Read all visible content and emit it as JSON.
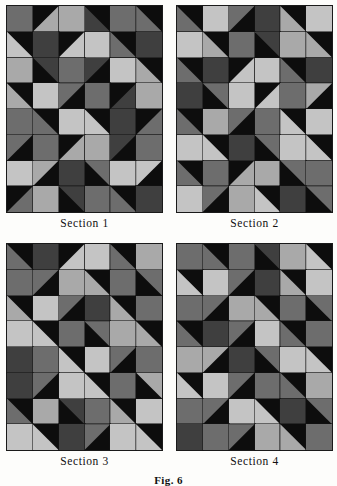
{
  "figure": {
    "label": "Fig. 6",
    "palette": {
      "black": "#0d0d0d",
      "dark_gray": "#3f3f3f",
      "mid_gray": "#6d6d6d",
      "light_gray": "#a9a9a9",
      "pale_gray": "#c4c4c4",
      "background": "#fdfdfb"
    },
    "grid": {
      "columns": 6,
      "rows": 8
    },
    "panels": [
      {
        "caption": "Section 1",
        "x": 6,
        "y": 5,
        "width": 157,
        "height": 208,
        "cells": [
          [
            {
              "base": "mid_gray"
            },
            {
              "base": "black",
              "tri": "light_gray",
              "dir": "br"
            },
            {
              "base": "light_gray"
            },
            {
              "base": "dark_gray",
              "tri": "black",
              "dir": "tr"
            },
            {
              "base": "mid_gray"
            },
            {
              "base": "black",
              "tri": "mid_gray",
              "dir": "bl"
            }
          ],
          [
            {
              "base": "black",
              "tri": "pale_gray",
              "dir": "bl"
            },
            {
              "base": "dark_gray"
            },
            {
              "base": "black",
              "tri": "pale_gray",
              "dir": "br"
            },
            {
              "base": "pale_gray"
            },
            {
              "base": "black",
              "tri": "mid_gray",
              "dir": "bl"
            },
            {
              "base": "dark_gray"
            }
          ],
          [
            {
              "base": "light_gray"
            },
            {
              "base": "black",
              "tri": "dark_gray",
              "dir": "tr"
            },
            {
              "base": "mid_gray"
            },
            {
              "base": "dark_gray",
              "tri": "black",
              "dir": "br"
            },
            {
              "base": "pale_gray"
            },
            {
              "base": "black",
              "tri": "light_gray",
              "dir": "bl"
            }
          ],
          [
            {
              "base": "black",
              "tri": "light_gray",
              "dir": "bl"
            },
            {
              "base": "pale_gray"
            },
            {
              "base": "black",
              "tri": "mid_gray",
              "dir": "tl"
            },
            {
              "base": "mid_gray"
            },
            {
              "base": "black",
              "tri": "dark_gray",
              "dir": "br"
            },
            {
              "base": "light_gray"
            }
          ],
          [
            {
              "base": "mid_gray"
            },
            {
              "base": "black",
              "tri": "mid_gray",
              "dir": "bl"
            },
            {
              "base": "pale_gray"
            },
            {
              "base": "black",
              "tri": "pale_gray",
              "dir": "bl"
            },
            {
              "base": "dark_gray"
            },
            {
              "base": "black",
              "tri": "mid_gray",
              "dir": "br"
            }
          ],
          [
            {
              "base": "black",
              "tri": "mid_gray",
              "dir": "tl"
            },
            {
              "base": "mid_gray"
            },
            {
              "base": "black",
              "tri": "light_gray",
              "dir": "br"
            },
            {
              "base": "light_gray"
            },
            {
              "base": "dark_gray",
              "tri": "black",
              "dir": "br"
            },
            {
              "base": "mid_gray"
            }
          ],
          [
            {
              "base": "pale_gray"
            },
            {
              "base": "black",
              "tri": "light_gray",
              "dir": "tl"
            },
            {
              "base": "dark_gray"
            },
            {
              "base": "black",
              "tri": "mid_gray",
              "dir": "tr"
            },
            {
              "base": "pale_gray"
            },
            {
              "base": "black",
              "tri": "pale_gray",
              "dir": "tl"
            }
          ],
          [
            {
              "base": "black",
              "tri": "mid_gray",
              "dir": "br"
            },
            {
              "base": "light_gray"
            },
            {
              "base": "black",
              "tri": "dark_gray",
              "dir": "tr"
            },
            {
              "base": "mid_gray"
            },
            {
              "base": "black",
              "tri": "mid_gray",
              "dir": "bl"
            },
            {
              "base": "dark_gray"
            }
          ]
        ]
      },
      {
        "caption": "Section 2",
        "x": 176,
        "y": 5,
        "width": 157,
        "height": 208,
        "cells": [
          [
            {
              "base": "black",
              "tri": "mid_gray",
              "dir": "bl"
            },
            {
              "base": "pale_gray"
            },
            {
              "base": "black",
              "tri": "mid_gray",
              "dir": "tl"
            },
            {
              "base": "dark_gray"
            },
            {
              "base": "black",
              "tri": "light_gray",
              "dir": "bl"
            },
            {
              "base": "pale_gray"
            }
          ],
          [
            {
              "base": "pale_gray"
            },
            {
              "base": "black",
              "tri": "light_gray",
              "dir": "bl"
            },
            {
              "base": "mid_gray"
            },
            {
              "base": "black",
              "tri": "dark_gray",
              "dir": "tr"
            },
            {
              "base": "light_gray"
            },
            {
              "base": "black",
              "tri": "light_gray",
              "dir": "bl"
            }
          ],
          [
            {
              "base": "black",
              "tri": "mid_gray",
              "dir": "bl"
            },
            {
              "base": "dark_gray"
            },
            {
              "base": "black",
              "tri": "pale_gray",
              "dir": "br"
            },
            {
              "base": "pale_gray"
            },
            {
              "base": "black",
              "tri": "mid_gray",
              "dir": "bl"
            },
            {
              "base": "dark_gray"
            }
          ],
          [
            {
              "base": "dark_gray"
            },
            {
              "base": "black",
              "tri": "mid_gray",
              "dir": "tr"
            },
            {
              "base": "pale_gray"
            },
            {
              "base": "black",
              "tri": "pale_gray",
              "dir": "br"
            },
            {
              "base": "mid_gray"
            },
            {
              "base": "black",
              "tri": "light_gray",
              "dir": "tl"
            }
          ],
          [
            {
              "base": "black",
              "tri": "mid_gray",
              "dir": "bl"
            },
            {
              "base": "light_gray"
            },
            {
              "base": "black",
              "tri": "mid_gray",
              "dir": "tl"
            },
            {
              "base": "mid_gray"
            },
            {
              "base": "black",
              "tri": "pale_gray",
              "dir": "bl"
            },
            {
              "base": "pale_gray"
            }
          ],
          [
            {
              "base": "pale_gray"
            },
            {
              "base": "black",
              "tri": "pale_gray",
              "dir": "bl"
            },
            {
              "base": "dark_gray"
            },
            {
              "base": "black",
              "tri": "mid_gray",
              "dir": "tr"
            },
            {
              "base": "pale_gray"
            },
            {
              "base": "black",
              "tri": "pale_gray",
              "dir": "bl"
            }
          ],
          [
            {
              "base": "black",
              "tri": "mid_gray",
              "dir": "bl"
            },
            {
              "base": "mid_gray"
            },
            {
              "base": "black",
              "tri": "light_gray",
              "dir": "br"
            },
            {
              "base": "light_gray"
            },
            {
              "base": "black",
              "tri": "mid_gray",
              "dir": "tr"
            },
            {
              "base": "mid_gray"
            }
          ],
          [
            {
              "base": "pale_gray"
            },
            {
              "base": "black",
              "tri": "mid_gray",
              "dir": "tl"
            },
            {
              "base": "light_gray"
            },
            {
              "base": "black",
              "tri": "pale_gray",
              "dir": "bl"
            },
            {
              "base": "dark_gray"
            },
            {
              "base": "black",
              "tri": "mid_gray",
              "dir": "tr"
            }
          ]
        ]
      },
      {
        "caption": "Section 3",
        "x": 6,
        "y": 243,
        "width": 157,
        "height": 208,
        "cells": [
          [
            {
              "base": "black",
              "tri": "mid_gray",
              "dir": "bl"
            },
            {
              "base": "dark_gray"
            },
            {
              "base": "black",
              "tri": "pale_gray",
              "dir": "br"
            },
            {
              "base": "pale_gray"
            },
            {
              "base": "black",
              "tri": "mid_gray",
              "dir": "bl"
            },
            {
              "base": "light_gray"
            }
          ],
          [
            {
              "base": "mid_gray"
            },
            {
              "base": "black",
              "tri": "mid_gray",
              "dir": "tl"
            },
            {
              "base": "light_gray"
            },
            {
              "base": "black",
              "tri": "light_gray",
              "dir": "bl"
            },
            {
              "base": "mid_gray"
            },
            {
              "base": "black",
              "tri": "mid_gray",
              "dir": "tr"
            }
          ],
          [
            {
              "base": "black",
              "tri": "light_gray",
              "dir": "bl"
            },
            {
              "base": "pale_gray"
            },
            {
              "base": "black",
              "tri": "mid_gray",
              "dir": "tl"
            },
            {
              "base": "dark_gray"
            },
            {
              "base": "black",
              "tri": "light_gray",
              "dir": "bl"
            },
            {
              "base": "mid_gray"
            }
          ],
          [
            {
              "base": "pale_gray"
            },
            {
              "base": "black",
              "tri": "pale_gray",
              "dir": "bl"
            },
            {
              "base": "mid_gray"
            },
            {
              "base": "black",
              "tri": "mid_gray",
              "dir": "tr"
            },
            {
              "base": "light_gray"
            },
            {
              "base": "black",
              "tri": "light_gray",
              "dir": "bl"
            }
          ],
          [
            {
              "base": "dark_gray"
            },
            {
              "base": "mid_gray"
            },
            {
              "base": "black",
              "tri": "pale_gray",
              "dir": "bl"
            },
            {
              "base": "pale_gray"
            },
            {
              "base": "black",
              "tri": "mid_gray",
              "dir": "tl"
            },
            {
              "base": "mid_gray"
            }
          ],
          [
            {
              "base": "dark_gray"
            },
            {
              "base": "black",
              "tri": "mid_gray",
              "dir": "tl"
            },
            {
              "base": "pale_gray"
            },
            {
              "base": "black",
              "tri": "pale_gray",
              "dir": "bl"
            },
            {
              "base": "mid_gray"
            },
            {
              "base": "black",
              "tri": "light_gray",
              "dir": "tr"
            }
          ],
          [
            {
              "base": "black",
              "tri": "mid_gray",
              "dir": "bl"
            },
            {
              "base": "light_gray"
            },
            {
              "base": "black",
              "tri": "dark_gray",
              "dir": "tr"
            },
            {
              "base": "mid_gray"
            },
            {
              "base": "black",
              "tri": "light_gray",
              "dir": "bl"
            },
            {
              "base": "pale_gray"
            }
          ],
          [
            {
              "base": "pale_gray"
            },
            {
              "base": "black",
              "tri": "pale_gray",
              "dir": "bl"
            },
            {
              "base": "dark_gray"
            },
            {
              "base": "black",
              "tri": "mid_gray",
              "dir": "tl"
            },
            {
              "base": "pale_gray"
            },
            {
              "base": "black",
              "tri": "pale_gray",
              "dir": "bl"
            }
          ]
        ]
      },
      {
        "caption": "Section 4",
        "x": 176,
        "y": 243,
        "width": 157,
        "height": 208,
        "cells": [
          [
            {
              "base": "mid_gray"
            },
            {
              "base": "black",
              "tri": "mid_gray",
              "dir": "bl"
            },
            {
              "base": "mid_gray"
            },
            {
              "base": "black",
              "tri": "dark_gray",
              "dir": "tr"
            },
            {
              "base": "light_gray"
            },
            {
              "base": "black",
              "tri": "pale_gray",
              "dir": "bl"
            }
          ],
          [
            {
              "base": "black",
              "tri": "pale_gray",
              "dir": "bl"
            },
            {
              "base": "pale_gray"
            },
            {
              "base": "black",
              "tri": "mid_gray",
              "dir": "tl"
            },
            {
              "base": "dark_gray"
            },
            {
              "base": "black",
              "tri": "light_gray",
              "dir": "bl"
            },
            {
              "base": "pale_gray"
            }
          ],
          [
            {
              "base": "mid_gray"
            },
            {
              "base": "black",
              "tri": "mid_gray",
              "dir": "tl"
            },
            {
              "base": "light_gray"
            },
            {
              "base": "black",
              "tri": "light_gray",
              "dir": "bl"
            },
            {
              "base": "mid_gray"
            },
            {
              "base": "black",
              "tri": "mid_gray",
              "dir": "tr"
            }
          ],
          [
            {
              "base": "black",
              "tri": "mid_gray",
              "dir": "bl"
            },
            {
              "base": "dark_gray"
            },
            {
              "base": "black",
              "tri": "mid_gray",
              "dir": "tl"
            },
            {
              "base": "pale_gray"
            },
            {
              "base": "black",
              "tri": "mid_gray",
              "dir": "bl"
            },
            {
              "base": "mid_gray"
            }
          ],
          [
            {
              "base": "light_gray"
            },
            {
              "base": "black",
              "tri": "light_gray",
              "dir": "tl"
            },
            {
              "base": "dark_gray"
            },
            {
              "base": "black",
              "tri": "mid_gray",
              "dir": "tr"
            },
            {
              "base": "pale_gray"
            },
            {
              "base": "black",
              "tri": "pale_gray",
              "dir": "bl"
            }
          ],
          [
            {
              "base": "black",
              "tri": "pale_gray",
              "dir": "bl"
            },
            {
              "base": "pale_gray"
            },
            {
              "base": "black",
              "tri": "mid_gray",
              "dir": "tl"
            },
            {
              "base": "mid_gray"
            },
            {
              "base": "black",
              "tri": "mid_gray",
              "dir": "bl"
            },
            {
              "base": "light_gray"
            }
          ],
          [
            {
              "base": "mid_gray"
            },
            {
              "base": "black",
              "tri": "mid_gray",
              "dir": "tl"
            },
            {
              "base": "pale_gray"
            },
            {
              "base": "black",
              "tri": "pale_gray",
              "dir": "bl"
            },
            {
              "base": "dark_gray"
            },
            {
              "base": "black",
              "tri": "mid_gray",
              "dir": "tr"
            }
          ],
          [
            {
              "base": "dark_gray"
            },
            {
              "base": "mid_gray"
            },
            {
              "base": "black",
              "tri": "mid_gray",
              "dir": "tl"
            },
            {
              "base": "light_gray"
            },
            {
              "base": "black",
              "tri": "light_gray",
              "dir": "bl"
            },
            {
              "base": "mid_gray"
            }
          ]
        ]
      }
    ]
  }
}
